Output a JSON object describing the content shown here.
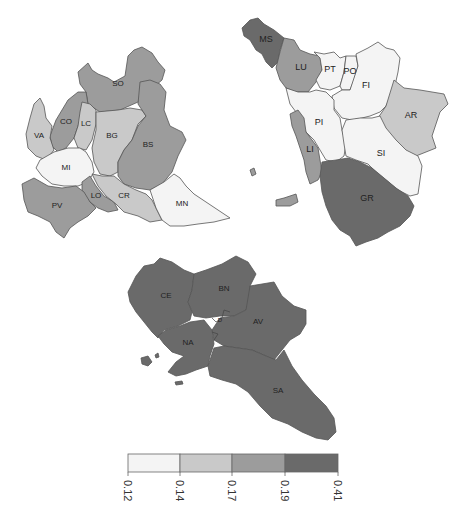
{
  "palette": {
    "c1": "#f4f4f4",
    "c2": "#c9c9c9",
    "c3": "#9c9c9c",
    "c4": "#6a6a6a",
    "border": "#555555"
  },
  "maps": {
    "lombardia": {
      "name": "Lombardia",
      "regions": [
        {
          "code": "SO",
          "class": 3
        },
        {
          "code": "CO",
          "class": 3
        },
        {
          "code": "LC",
          "class": 2
        },
        {
          "code": "VA",
          "class": 2
        },
        {
          "code": "BG",
          "class": 2
        },
        {
          "code": "BS",
          "class": 3
        },
        {
          "code": "MI",
          "class": 1
        },
        {
          "code": "LO",
          "class": 3
        },
        {
          "code": "CR",
          "class": 2
        },
        {
          "code": "PV",
          "class": 3
        },
        {
          "code": "MN",
          "class": 1
        }
      ]
    },
    "toscana": {
      "name": "Toscana",
      "regions": [
        {
          "code": "MS",
          "class": 4
        },
        {
          "code": "LU",
          "class": 3
        },
        {
          "code": "PT",
          "class": 1
        },
        {
          "code": "PO",
          "class": 1
        },
        {
          "code": "FI",
          "class": 1
        },
        {
          "code": "PI",
          "class": 1
        },
        {
          "code": "AR",
          "class": 2
        },
        {
          "code": "LI",
          "class": 3
        },
        {
          "code": "SI",
          "class": 1
        },
        {
          "code": "GR",
          "class": 4
        }
      ]
    },
    "campania": {
      "name": "Campania",
      "regions": [
        {
          "code": "CE",
          "class": 4
        },
        {
          "code": "BN",
          "class": 4
        },
        {
          "code": "AV",
          "class": 4
        },
        {
          "code": "NA",
          "class": 4
        },
        {
          "code": "SA",
          "class": 4
        },
        {
          "code": "D",
          "class": 4
        }
      ]
    }
  },
  "labels": {
    "SO": "SO",
    "CO": "CO",
    "LC": "LC",
    "VA": "VA",
    "BG": "BG",
    "BS": "BS",
    "MI": "MI",
    "LO": "LO",
    "CR": "CR",
    "PV": "PV",
    "MN": "MN",
    "MS": "MS",
    "LU": "LU",
    "PT": "PT",
    "PO": "PO",
    "FI": "FI",
    "PI": "PI",
    "AR": "AR",
    "LI": "LI",
    "SI": "SI",
    "GR": "GR",
    "CE": "CE",
    "BN": "BN",
    "AV": "AV",
    "NA": "NA",
    "SA": "SA",
    "D": "D"
  },
  "legend": {
    "breaks": [
      "0.12",
      "0.14",
      "0.17",
      "0.19",
      "0.41"
    ],
    "colors": [
      "#f4f4f4",
      "#c9c9c9",
      "#9c9c9c",
      "#6a6a6a"
    ]
  }
}
